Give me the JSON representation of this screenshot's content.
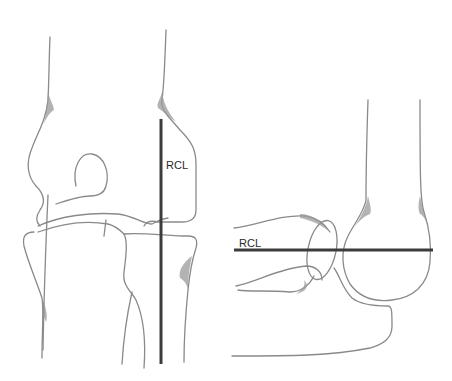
{
  "figure": {
    "panels": [
      {
        "id": "ap-view",
        "label": "RCL",
        "line_orientation": "vertical"
      },
      {
        "id": "lateral-view",
        "label": "RCL",
        "line_orientation": "horizontal"
      }
    ],
    "colors": {
      "outline": "#8a8a8a",
      "line": "#3c3c3c",
      "background": "#ffffff"
    }
  }
}
